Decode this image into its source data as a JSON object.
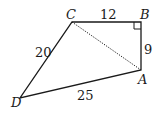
{
  "diagram": {
    "type": "quadrilateral",
    "points": {
      "C": {
        "label": "C",
        "x": 72,
        "y": 22
      },
      "B": {
        "label": "B",
        "x": 141,
        "y": 22
      },
      "A": {
        "label": "A",
        "x": 141,
        "y": 70
      },
      "D": {
        "label": "D",
        "x": 20,
        "y": 98
      }
    },
    "sides": {
      "CB": "12",
      "BA": "9",
      "CD": "20",
      "DA": "25"
    },
    "diagonal": {
      "from": "C",
      "to": "A",
      "style": "dotted"
    },
    "right_angle_at": "B",
    "colors": {
      "stroke": "#1a1a1a",
      "background": "#ffffff"
    }
  }
}
